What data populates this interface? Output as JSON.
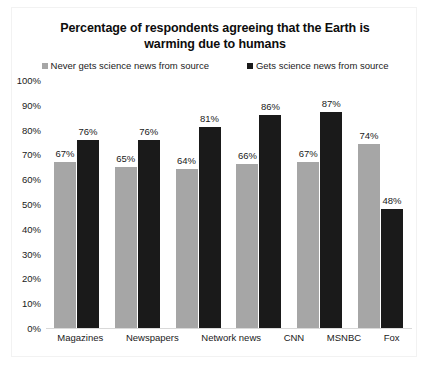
{
  "chart_data": {
    "type": "bar",
    "title": "Percentage of respondents agreeing that the Earth is warming due to humans",
    "title_line1": "Percentage of respondents agreeing that the Earth is",
    "title_line2": "warming due to humans",
    "xlabel": "",
    "ylabel": "",
    "ylim": [
      0,
      100
    ],
    "y_ticks": [
      "100%",
      "90%",
      "80%",
      "70%",
      "60%",
      "50%",
      "40%",
      "30%",
      "20%",
      "10%",
      "0%"
    ],
    "y_tick_values": [
      100,
      90,
      80,
      70,
      60,
      50,
      40,
      30,
      20,
      10,
      0
    ],
    "grid": false,
    "legend_position": "top",
    "categories": [
      "Magazines",
      "Newspapers",
      "Network news",
      "CNN",
      "MSNBC",
      "Fox"
    ],
    "series": [
      {
        "name": "Never gets science news from source",
        "color": "#a6a6a6",
        "values": [
          67,
          65,
          64,
          66,
          67,
          74
        ],
        "labels": [
          "67%",
          "65%",
          "64%",
          "66%",
          "67%",
          "74%"
        ]
      },
      {
        "name": "Gets science news from source",
        "color": "#1a1a1a",
        "values": [
          76,
          76,
          81,
          86,
          87,
          48
        ],
        "labels": [
          "76%",
          "76%",
          "81%",
          "86%",
          "87%",
          "48%"
        ]
      }
    ]
  },
  "legend": {
    "items": [
      {
        "label": "Never gets science news from source",
        "swatch": "gray"
      },
      {
        "label": "Gets science news from source",
        "swatch": "black"
      }
    ]
  }
}
